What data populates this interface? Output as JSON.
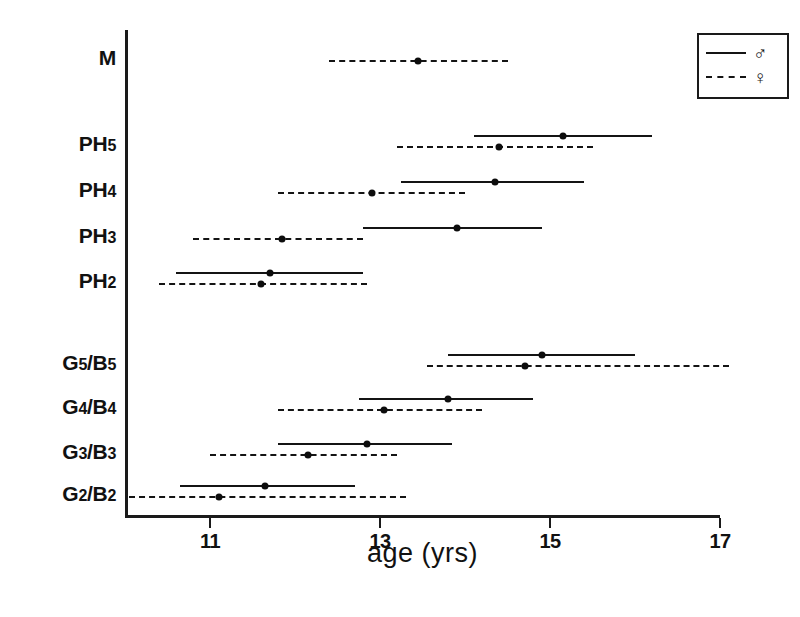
{
  "chart_data": {
    "type": "line",
    "title": "",
    "xlabel": "age (yrs)",
    "ylabel": "",
    "xlim": [
      10.0,
      17.0
    ],
    "xticks": [
      11,
      13,
      15,
      17
    ],
    "xtick_labels": [
      "11",
      "13",
      "15",
      "17"
    ],
    "grid": false,
    "legend_position": "top-right",
    "legend": [
      {
        "key": "male",
        "symbol": "♂",
        "style": "solid",
        "label": "♂"
      },
      {
        "key": "female",
        "symbol": "♀",
        "style": "dashed",
        "label": "♀"
      }
    ],
    "categories": [
      "M",
      "PH5",
      "PH4",
      "PH3",
      "PH2",
      "G5/B5",
      "G4/B4",
      "G3/B3",
      "G2/B2"
    ],
    "series": [
      {
        "name": "♂",
        "style": "solid",
        "points": [
          {
            "category": "M",
            "start": null,
            "mean": null,
            "end": null
          },
          {
            "category": "PH5",
            "start": 14.1,
            "mean": 15.15,
            "end": 16.2
          },
          {
            "category": "PH4",
            "start": 13.25,
            "mean": 14.35,
            "end": 15.4
          },
          {
            "category": "PH3",
            "start": 12.8,
            "mean": 13.9,
            "end": 14.9
          },
          {
            "category": "PH2",
            "start": 10.6,
            "mean": 11.7,
            "end": 12.8
          },
          {
            "category": "G5/B5",
            "start": 13.8,
            "mean": 14.9,
            "end": 16.0
          },
          {
            "category": "G4/B4",
            "start": 12.75,
            "mean": 13.8,
            "end": 14.8
          },
          {
            "category": "G3/B3",
            "start": 11.8,
            "mean": 12.85,
            "end": 13.85
          },
          {
            "category": "G2/B2",
            "start": 10.65,
            "mean": 11.65,
            "end": 12.7
          }
        ]
      },
      {
        "name": "♀",
        "style": "dashed",
        "points": [
          {
            "category": "M",
            "start": 12.4,
            "mean": 13.45,
            "end": 14.5
          },
          {
            "category": "PH5",
            "start": 13.2,
            "mean": 14.4,
            "end": 15.5
          },
          {
            "category": "PH4",
            "start": 11.8,
            "mean": 12.9,
            "end": 14.0
          },
          {
            "category": "PH3",
            "start": 10.8,
            "mean": 11.85,
            "end": 12.8
          },
          {
            "category": "PH2",
            "start": 10.4,
            "mean": 11.6,
            "end": 12.85
          },
          {
            "category": "G5/B5",
            "start": 13.55,
            "mean": 14.7,
            "end": 17.1
          },
          {
            "category": "G4/B4",
            "start": 11.8,
            "mean": 13.05,
            "end": 14.2
          },
          {
            "category": "G3/B3",
            "start": 11.0,
            "mean": 12.15,
            "end": 13.2
          },
          {
            "category": "G2/B2",
            "start": 10.05,
            "mean": 11.1,
            "end": 13.3
          }
        ]
      }
    ]
  },
  "axis": {
    "x_label": "age (yrs)",
    "ticks": [
      {
        "value": 11,
        "label": "11"
      },
      {
        "value": 13,
        "label": "13"
      },
      {
        "value": 15,
        "label": "15"
      },
      {
        "value": 17,
        "label": "17"
      }
    ]
  },
  "category_labels": [
    {
      "id": "M",
      "main": "M",
      "sub": "",
      "main2": "",
      "sub2": ""
    },
    {
      "id": "PH5",
      "main": "PH",
      "sub": "5",
      "main2": "",
      "sub2": ""
    },
    {
      "id": "PH4",
      "main": "PH",
      "sub": "4",
      "main2": "",
      "sub2": ""
    },
    {
      "id": "PH3",
      "main": "PH",
      "sub": "3",
      "main2": "",
      "sub2": ""
    },
    {
      "id": "PH2",
      "main": "PH",
      "sub": "2",
      "main2": "",
      "sub2": ""
    },
    {
      "id": "G5/B5",
      "main": "G",
      "sub": "5",
      "main2": "/B",
      "sub2": "5"
    },
    {
      "id": "G4/B4",
      "main": "G",
      "sub": "4",
      "main2": "/B",
      "sub2": "4"
    },
    {
      "id": "G3/B3",
      "main": "G",
      "sub": "3",
      "main2": "/B",
      "sub2": "3"
    },
    {
      "id": "G2/B2",
      "main": "G",
      "sub": "2",
      "main2": "/B",
      "sub2": "2"
    }
  ],
  "legend": {
    "male_symbol": "♂",
    "female_symbol": "♀"
  },
  "colors": {
    "ink": "#141414",
    "background": "#ffffff"
  }
}
